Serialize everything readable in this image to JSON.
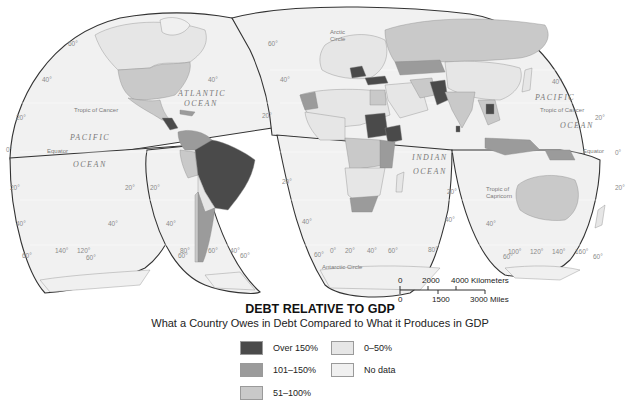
{
  "map": {
    "projection": "interrupted-goode-homolosine",
    "ocean_labels": {
      "atlantic_1": "ATLANTIC",
      "atlantic_2": "OCEAN",
      "pacific_w_1": "PACIFIC",
      "pacific_w_2": "OCEAN",
      "indian_1": "INDIAN",
      "indian_2": "OCEAN",
      "pacific_e_1": "PACIFIC",
      "pacific_e_2": "OCEAN"
    },
    "line_labels": {
      "tropic_cancer_w": "Tropic of Cancer",
      "tropic_cancer_e": "Tropic of Cancer",
      "equator_w": "Equator",
      "equator_e": "Equator",
      "tropic_capricorn_1": "Tropic of",
      "tropic_capricorn_2": "Capricorn",
      "arctic_1": "Arctic",
      "arctic_2": "Circle",
      "antarctic": "Antarctic Circle"
    },
    "degree_labels": {
      "d60": "60°",
      "d40": "40°",
      "d20": "20°",
      "d0": "0°",
      "d80": "80°",
      "d100": "100°",
      "d120": "120°",
      "d140": "140°",
      "d160": "160°"
    }
  },
  "scale_bar": {
    "km_labels": [
      "0",
      "2000",
      "4000 Kilometers"
    ],
    "mi_labels": [
      "0",
      "1500",
      "3000 Miles"
    ]
  },
  "legend": {
    "title": "DEBT RELATIVE TO GDP",
    "subtitle": "What a Country Owes in Debt Compared to What it Produces in GDP",
    "items": [
      {
        "label": "Over 150%",
        "color": "#4a4a4a"
      },
      {
        "label": "101–150%",
        "color": "#9b9b9b"
      },
      {
        "label": "51–100%",
        "color": "#c9c9c9"
      },
      {
        "label": "0–50%",
        "color": "#e6e6e6"
      },
      {
        "label": "No data",
        "color": "#f0f0f0"
      }
    ]
  },
  "colors": {
    "ocean": "#f1f1f1",
    "outline": "#333333",
    "over150": "#4a4a4a",
    "r101_150": "#9b9b9b",
    "r51_100": "#c9c9c9",
    "r0_50": "#e6e6e6"
  }
}
